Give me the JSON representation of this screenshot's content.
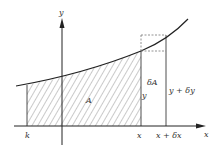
{
  "diagram": {
    "colors": {
      "stroke": "#222222",
      "hatch": "#555555",
      "dashed": "#777777",
      "text": "#333333",
      "background": "#ffffff"
    },
    "axes": {
      "x_label": "x",
      "y_label": "y"
    },
    "regions": {
      "area_label": "A",
      "increment_label": "δA"
    },
    "ordinates": {
      "left_height_label": "y",
      "right_height_label": "y + δy"
    },
    "x_ticks": {
      "start_label": "k",
      "x_label": "x",
      "x_plus_dx_label": "x + δx"
    }
  }
}
